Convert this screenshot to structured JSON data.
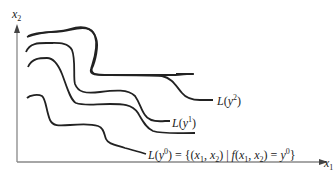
{
  "diagram": {
    "type": "level-set-diagram",
    "axes": {
      "x_label": "x",
      "x_label_sub": "1",
      "y_label": "x",
      "y_label_sub": "2",
      "color": "#888888"
    },
    "curves": [
      {
        "id": "L0",
        "label_prefix": "L(y",
        "label_sup": "0",
        "label_suffix": ") = {(x",
        "full_label": "L(y0) = {(x1, x2) | f(x1, x2) = y0}",
        "color": "#222222"
      },
      {
        "id": "L1",
        "label_prefix": "L(y",
        "label_sup": "1",
        "label_suffix": ")",
        "full_label": "L(y1)",
        "color": "#222222"
      },
      {
        "id": "L2",
        "label_prefix": "L(y",
        "label_sup": "2",
        "label_suffix": ")",
        "full_label": "L(y2)",
        "color": "#222222"
      }
    ]
  }
}
